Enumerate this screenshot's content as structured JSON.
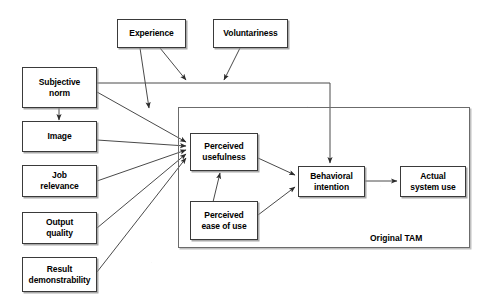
{
  "diagram": {
    "frame_label": "Original TAM",
    "line_color": "#4a4a4a",
    "box_border_color": "#3a3a3a",
    "background": "#ffffff"
  },
  "nodes": {
    "experience": {
      "label": "Experience"
    },
    "voluntariness": {
      "label": "Voluntariness"
    },
    "subjective_norm": {
      "label": "Subjective\nnorm"
    },
    "image": {
      "label": "Image"
    },
    "job_relevance": {
      "label": "Job\nrelevance"
    },
    "output_quality": {
      "label": "Output\nquality"
    },
    "result_demonstrability": {
      "label": "Result\ndemonstrability"
    },
    "perceived_usefulness": {
      "label": "Perceived\nusefulness"
    },
    "perceived_ease_of_use": {
      "label": "Perceived\nease of use"
    },
    "behavioral_intention": {
      "label": "Behavioral\nintention"
    },
    "actual_system_use": {
      "label": "Actual\nsystem use"
    }
  },
  "edges": [
    {
      "from": "subjective_norm",
      "to": "image",
      "type": "arrow"
    },
    {
      "from": "subjective_norm",
      "to": "perceived_usefulness",
      "type": "arrow"
    },
    {
      "from": "subjective_norm",
      "to": "behavioral_intention",
      "type": "arrow-elbow"
    },
    {
      "from": "image",
      "to": "perceived_usefulness",
      "type": "arrow"
    },
    {
      "from": "job_relevance",
      "to": "perceived_usefulness",
      "type": "arrow"
    },
    {
      "from": "output_quality",
      "to": "perceived_usefulness",
      "type": "arrow"
    },
    {
      "from": "result_demonstrability",
      "to": "perceived_usefulness",
      "type": "arrow"
    },
    {
      "from": "experience",
      "to": "subjective_norm_link",
      "type": "arrow"
    },
    {
      "from": "experience",
      "to": "subjective_norm_bi_link",
      "type": "arrow"
    },
    {
      "from": "voluntariness",
      "to": "subjective_norm_bi_link",
      "type": "arrow"
    },
    {
      "from": "perceived_ease_of_use",
      "to": "perceived_usefulness",
      "type": "arrow"
    },
    {
      "from": "perceived_usefulness",
      "to": "behavioral_intention",
      "type": "arrow"
    },
    {
      "from": "perceived_ease_of_use",
      "to": "behavioral_intention",
      "type": "arrow"
    },
    {
      "from": "behavioral_intention",
      "to": "actual_system_use",
      "type": "arrow"
    }
  ]
}
